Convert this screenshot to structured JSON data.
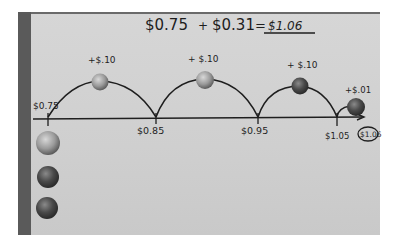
{
  "equation": {
    "left": "$0.75",
    "plus": "+",
    "addend": "$0.31",
    "equals": "=",
    "result": "$1.06"
  },
  "number_line": {
    "points": [
      {
        "label": "$0.75",
        "x": 48
      },
      {
        "label": "$0.85",
        "x": 156
      },
      {
        "label": "$0.95",
        "x": 258
      },
      {
        "label": "$1.05",
        "x": 337
      },
      {
        "label": "$1.06",
        "x": 360,
        "circled": true
      }
    ],
    "jumps": [
      {
        "label": "+$.10",
        "coin": "dime"
      },
      {
        "label": "+ $.10",
        "coin": "dime"
      },
      {
        "label": "+ $.10",
        "coin": "dime"
      },
      {
        "label": "+$.01",
        "coin": "penny"
      }
    ]
  },
  "start_coins": [
    "quarter",
    "quarter-dark",
    "penny"
  ],
  "colors": {
    "paper": "#d2d2d2",
    "ink": "#1e1e1e",
    "strip": "#5a5a5a",
    "silver_coin": "#9a9a9a",
    "copper_coin": "#4a4a4a"
  }
}
